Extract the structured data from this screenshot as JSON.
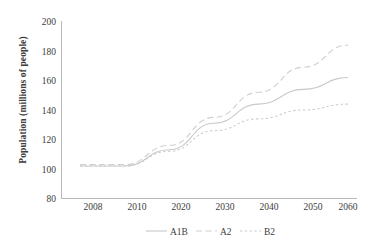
{
  "chart_data": {
    "type": "line",
    "title": "",
    "xlabel": "",
    "ylabel": "Population (millions of people)",
    "categories": [
      "2008",
      "2010",
      "2020",
      "2030",
      "2040",
      "2050",
      "2060"
    ],
    "ylim": [
      80,
      200
    ],
    "yticks": [
      80,
      100,
      120,
      140,
      160,
      180,
      200
    ],
    "grid": false,
    "legend_position": "bottom",
    "series": [
      {
        "name": "A1B",
        "style": "solid",
        "color": "#c9c9c9",
        "values": [
          102,
          102,
          113,
          131,
          144,
          154,
          162
        ]
      },
      {
        "name": "A2",
        "style": "dashed",
        "color": "#cfcfcf",
        "values": [
          103,
          103,
          116,
          135,
          152,
          169,
          184
        ]
      },
      {
        "name": "B2",
        "style": "dotted",
        "color": "#cccccc",
        "values": [
          102,
          102,
          112,
          126,
          134,
          140,
          144
        ]
      }
    ]
  },
  "axis": {
    "ytick_labels": [
      "200",
      "180",
      "160",
      "140",
      "120",
      "100",
      "80"
    ],
    "xtick_labels": [
      "2008",
      "2010",
      "2020",
      "2030",
      "2040",
      "2050",
      "2060"
    ]
  },
  "legend": {
    "items": [
      {
        "label": "A1B"
      },
      {
        "label": "A2"
      },
      {
        "label": "B2"
      }
    ]
  },
  "colors": {
    "axis": "#b9b9b9",
    "text": "#3c3c3c",
    "background": "#ffffff"
  }
}
